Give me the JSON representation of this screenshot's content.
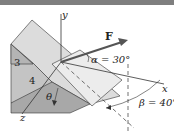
{
  "figure": {
    "type": "3d-statics-diagram",
    "force_label": "F",
    "axes": {
      "x": "x",
      "y": "y",
      "z": "z"
    },
    "dimensions": {
      "rise": "3",
      "run": "4"
    },
    "angles": {
      "alpha": "α = 30°",
      "beta": "β = 40°",
      "theta": "θ"
    },
    "colors": {
      "top_bar": "#7f7f7f",
      "face_light": "#dcdcdc",
      "face_mid": "#c4c4c4",
      "face_dark": "#a8a8a8",
      "force_arrow": "#555555",
      "lines": "#333333"
    }
  }
}
